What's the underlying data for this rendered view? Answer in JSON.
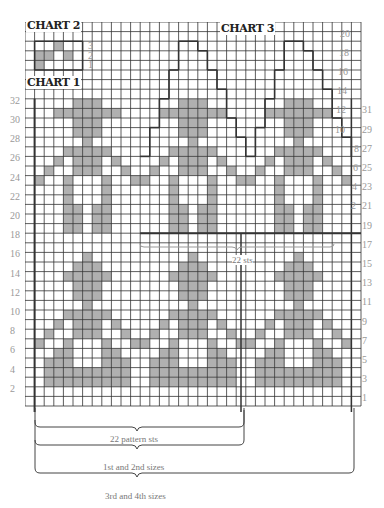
{
  "titles": {
    "chart1": "CHART 1",
    "chart2": "CHART 2",
    "chart3": "CHART 3"
  },
  "grid": {
    "cols": 35,
    "rows": 40,
    "cell": 9.6,
    "shade": "#b0b0b0",
    "line": "#333"
  },
  "motif_lower": [
    "00000100000",
    "00001110000",
    "00011111000",
    "00001110000",
    "00001110000",
    "00000100000",
    "00011111000",
    "00101110100",
    "01001110010",
    "10010001001",
    "00110001100",
    "01110001110",
    "01111111110",
    "01111111110",
    "00000000000",
    "00000000000"
  ],
  "motif_upper": [
    "00001110000",
    "00111111100",
    "00001110000",
    "00001110000",
    "00000100000",
    "00011111000",
    "00101110100",
    "01001110010",
    "10010001001",
    "00010001000",
    "00010001000",
    "00011011000",
    "00011011000",
    "00011011000"
  ],
  "chart2": {
    "rows": [
      "00100",
      "11010",
      "10000"
    ],
    "labels": [
      "3",
      "2",
      "1"
    ]
  },
  "left_labels": [
    "32",
    "30",
    "28",
    "26",
    "24",
    "22",
    "20",
    "18",
    "16",
    "14",
    "12",
    "10",
    "8",
    "6",
    "4",
    "2"
  ],
  "right_labels_odd": [
    "31",
    "29",
    "27",
    "25",
    "23",
    "21",
    "19",
    "17",
    "15",
    "13",
    "11",
    "9",
    "7",
    "5",
    "3",
    "1"
  ],
  "chart3_labels": [
    "20",
    "18",
    "16",
    "14",
    "12",
    "10",
    "8",
    "6",
    "4",
    "2"
  ],
  "braces": {
    "pattern": "22 pattern sts",
    "sizes12": "1st and 2nd sizes",
    "sizes34": "3rd and 4th sizes",
    "mid": "22 sts"
  }
}
